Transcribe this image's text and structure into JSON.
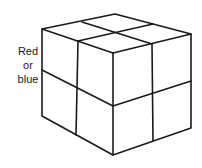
{
  "figure": {
    "type": "2x2x2 cube diagram",
    "label_lines": [
      "Red",
      "or",
      "blue"
    ],
    "stroke_color": "#1a1a1a",
    "background": "#ffffff"
  }
}
